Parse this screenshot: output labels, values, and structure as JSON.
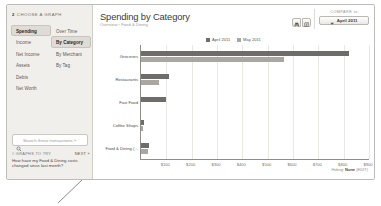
{
  "sidebar": {
    "step_number": "2",
    "step_label": "CHOOSE A GRAPH",
    "column_left": [
      {
        "label": "Spending",
        "selected": true
      },
      {
        "label": "Income",
        "selected": false
      },
      {
        "label": "Net Income",
        "selected": false
      },
      {
        "label": "Assets",
        "selected": false
      },
      {
        "label": "Debts",
        "selected": false
      },
      {
        "label": "Net Worth",
        "selected": false
      }
    ],
    "column_right": [
      {
        "label": "Over Time",
        "selected": false
      },
      {
        "label": "By Category",
        "selected": true
      },
      {
        "label": "By Merchant",
        "selected": false
      },
      {
        "label": "By Tag",
        "selected": false
      }
    ],
    "search": {
      "placeholder": "Search these transactions »",
      "value": "",
      "icon": "search-icon"
    },
    "promo": {
      "eyebrow": "# GRAPHS TO TRY",
      "next_label": "NEXT »",
      "text": "How have my Food & Dining costs changed since last month?"
    }
  },
  "header": {
    "title": "Spending by Category",
    "breadcrumb": "Overview › Food & Dining",
    "export_buttons": [
      {
        "icon": "print-icon",
        "label": ""
      },
      {
        "icon": "export-icon",
        "label": ""
      }
    ],
    "compare": {
      "label": "COMPARE to",
      "value": "April 2011",
      "caret_icon": "chevron-down-icon"
    }
  },
  "status": {
    "hiding_label": "Hiding:",
    "hiding_value": "None",
    "edit_label": "(EDIT)"
  },
  "chart_data": {
    "type": "bar",
    "orientation": "horizontal",
    "title": "Spending by Category",
    "xlabel": "",
    "ylabel": "",
    "grid": true,
    "legend_position": "top-center",
    "xlim": [
      0,
      900
    ],
    "xticks": [
      "$100",
      "$200",
      "$300",
      "$400",
      "$500",
      "$600",
      "$700",
      "$800",
      "$900"
    ],
    "xtick_values": [
      100,
      200,
      300,
      400,
      500,
      600,
      700,
      800,
      900
    ],
    "categories": [
      "Groceries",
      "Restaurants",
      "Fast Food",
      "Coffee Shops",
      "Food & Dining (..."
    ],
    "colors": {
      "april": "#6e6d69",
      "may": "#a8a7a2"
    },
    "series": [
      {
        "name": "April 2011",
        "color": "#6e6d69",
        "values": [
          820,
          112,
          100,
          10,
          30
        ]
      },
      {
        "name": "May 2011",
        "color": "#a8a7a2",
        "values": [
          565,
          70,
          0,
          6,
          26
        ]
      }
    ]
  }
}
